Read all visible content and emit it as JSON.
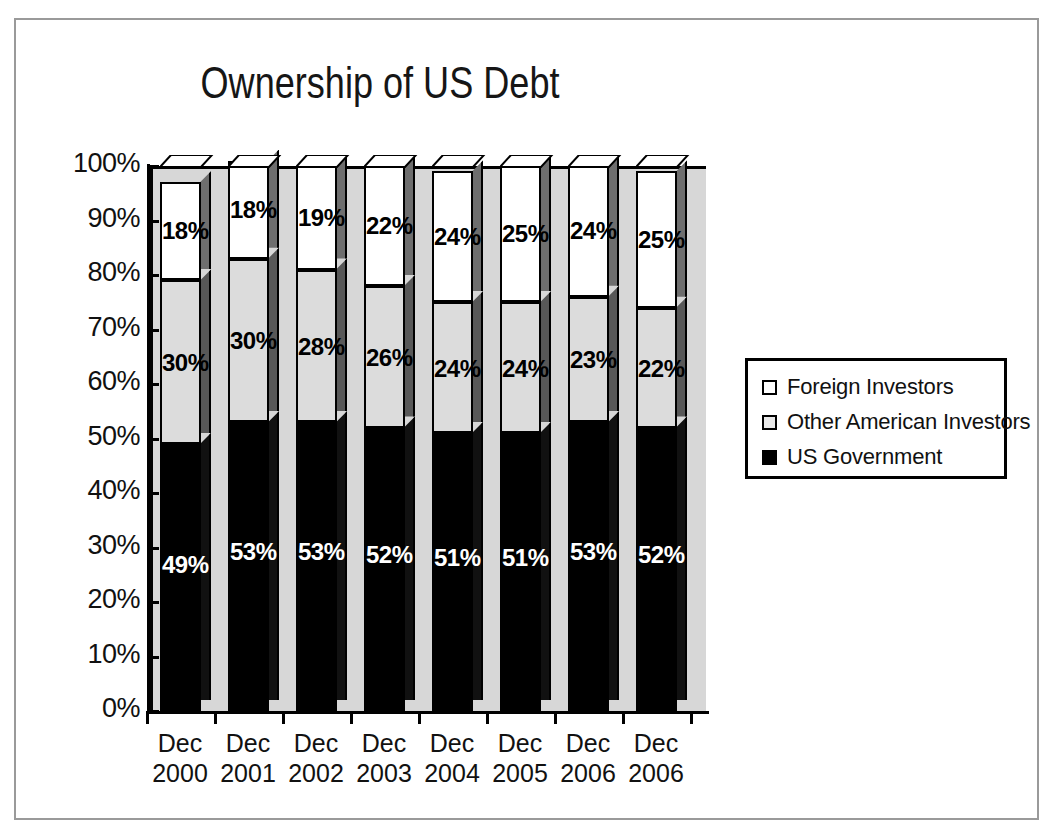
{
  "chart_data": {
    "type": "bar",
    "subtype": "stacked-100-percent-3d",
    "title": "Ownership of US Debt",
    "xlabel": "",
    "ylabel": "",
    "ylim": [
      0,
      100
    ],
    "ytick_labels": [
      "100%",
      "90%",
      "80%",
      "70%",
      "60%",
      "50%",
      "40%",
      "30%",
      "20%",
      "10%",
      "0%"
    ],
    "ytick_values": [
      100,
      90,
      80,
      70,
      60,
      50,
      40,
      30,
      20,
      10,
      0
    ],
    "grid": false,
    "legend_position": "right",
    "categories": [
      {
        "line1": "Dec",
        "line2": "2000"
      },
      {
        "line1": "Dec",
        "line2": "2001"
      },
      {
        "line1": "Dec",
        "line2": "2002"
      },
      {
        "line1": "Dec",
        "line2": "2003"
      },
      {
        "line1": "Dec",
        "line2": "2004"
      },
      {
        "line1": "Dec",
        "line2": "2005"
      },
      {
        "line1": "Dec",
        "line2": "2006"
      },
      {
        "line1": "Dec",
        "line2": "2006"
      }
    ],
    "series": [
      {
        "name": "US Government",
        "color": "#000000",
        "side_color": "#111111",
        "label_color": "#ffffff",
        "values": [
          49,
          53,
          53,
          52,
          51,
          51,
          53,
          52
        ],
        "labels": [
          "49%",
          "53%",
          "53%",
          "52%",
          "51%",
          "51%",
          "53%",
          "52%"
        ]
      },
      {
        "name": "Other American Investors",
        "color": "#dcdcdc",
        "side_color": "#585858",
        "label_color": "#000000",
        "values": [
          30,
          30,
          28,
          26,
          24,
          24,
          23,
          22
        ],
        "labels": [
          "30%",
          "30%",
          "28%",
          "26%",
          "24%",
          "24%",
          "23%",
          "22%"
        ]
      },
      {
        "name": "Foreign Investors",
        "color": "#ffffff",
        "side_color": "#6e6e6e",
        "label_color": "#000000",
        "values": [
          18,
          18,
          19,
          22,
          24,
          25,
          24,
          25
        ],
        "labels": [
          "18%",
          "18%",
          "19%",
          "22%",
          "24%",
          "25%",
          "24%",
          "25%"
        ]
      }
    ],
    "legend": [
      {
        "label": "Foreign Investors",
        "swatch": "#ffffff"
      },
      {
        "label": "Other American Investors",
        "swatch": "#e8e8e8"
      },
      {
        "label": "US Government",
        "swatch": "#000000"
      }
    ],
    "plot_background": "#d7d7d7",
    "frame_color": "#9a9a9a",
    "axis_color": "#000000"
  }
}
